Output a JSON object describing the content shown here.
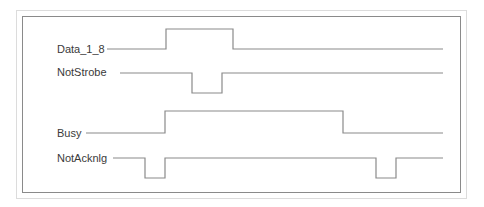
{
  "diagram": {
    "type": "timing-diagram",
    "line_color": "#8a8a8a",
    "signals": [
      {
        "name": "Data_1_8",
        "label_x": 57,
        "label_y": 43,
        "high_y": 29,
        "low_y": 49,
        "points": "107,49 166,49 166,29 233,29 233,49 443,49"
      },
      {
        "name": "NotStrobe",
        "label_x": 57,
        "label_y": 66,
        "high_y": 73,
        "low_y": 93,
        "points": "120,73 192,73 192,93 222,93 222,73 443,73"
      },
      {
        "name": "Busy",
        "label_x": 57,
        "label_y": 127,
        "high_y": 111,
        "low_y": 133,
        "points": "86,133 165,133 165,111 343,111 343,133 443,133"
      },
      {
        "name": "NotAcknlg",
        "label_x": 57,
        "label_y": 152,
        "high_y": 158,
        "low_y": 178,
        "points": "113,158 145,158 145,178 165,178 165,158 376,158 376,178 396,178 396,158 443,158"
      }
    ]
  }
}
